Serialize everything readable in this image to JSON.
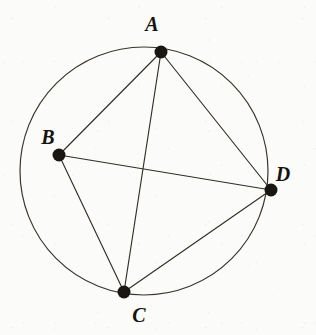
{
  "figure": {
    "type": "geometry-diagram",
    "background_color": "#fbfbf9",
    "ink_color": "#26221d",
    "canvas": {
      "width": 316,
      "height": 335
    }
  },
  "circle": {
    "name": "circumcircle",
    "center_x": 144,
    "center_y": 171,
    "radius": 124,
    "stroke_color": "#3a352e",
    "stroke_width": 1.2,
    "fill": "none"
  },
  "points": [
    {
      "id": "A",
      "label": "A",
      "x": 161,
      "y": 52,
      "dot_radius": 6.5,
      "dot_color": "#1a1713",
      "label_x": 152,
      "label_y": 31
    },
    {
      "id": "B",
      "label": "B",
      "x": 59,
      "y": 155,
      "dot_radius": 6.5,
      "dot_color": "#1a1713",
      "label_x": 48,
      "label_y": 144
    },
    {
      "id": "C",
      "label": "C",
      "x": 124,
      "y": 292,
      "dot_radius": 6.5,
      "dot_color": "#1a1713",
      "label_x": 139,
      "label_y": 322
    },
    {
      "id": "D",
      "label": "D",
      "x": 271,
      "y": 190,
      "dot_radius": 6.5,
      "dot_color": "#1a1713",
      "label_x": 283,
      "label_y": 181
    }
  ],
  "chords": [
    {
      "id": "AB",
      "from": "A",
      "to": "B",
      "x1": 161,
      "y1": 52,
      "x2": 59,
      "y2": 155
    },
    {
      "id": "AC",
      "from": "A",
      "to": "C",
      "x1": 161,
      "y1": 52,
      "x2": 124,
      "y2": 292
    },
    {
      "id": "AD",
      "from": "A",
      "to": "D",
      "x1": 161,
      "y1": 52,
      "x2": 271,
      "y2": 190
    },
    {
      "id": "BC",
      "from": "B",
      "to": "C",
      "x1": 59,
      "y1": 155,
      "x2": 124,
      "y2": 292
    },
    {
      "id": "BD",
      "from": "B",
      "to": "D",
      "x1": 59,
      "y1": 155,
      "x2": 271,
      "y2": 190
    },
    {
      "id": "CD",
      "from": "C",
      "to": "D",
      "x1": 124,
      "y1": 292,
      "x2": 271,
      "y2": 190
    }
  ]
}
